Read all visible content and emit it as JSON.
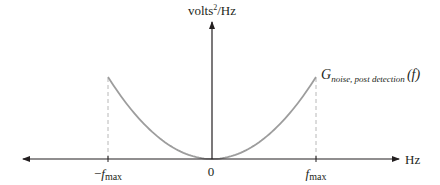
{
  "diagram": {
    "type": "power-spectral-density-sketch",
    "y_axis_label": {
      "main": "volts",
      "superscript": "2",
      "suffix": "/Hz"
    },
    "x_axis_label": "Hz",
    "curve_label": {
      "symbol": "G",
      "subscript": "noise, post detection",
      "argument": "(f)"
    },
    "tick_labels": {
      "neg_fmax": {
        "prefix": "−",
        "symbol": "f",
        "subscript": "max"
      },
      "zero": "0",
      "pos_fmax": {
        "symbol": "f",
        "subscript": "max"
      }
    },
    "curve_shape": "parabola (f^2) from −fmax to fmax, zero at origin",
    "colors": {
      "axis": "#231f20",
      "curve": "#9d9d9d",
      "dashed_guides": "#b8b8b8",
      "text": "#231f20"
    }
  }
}
